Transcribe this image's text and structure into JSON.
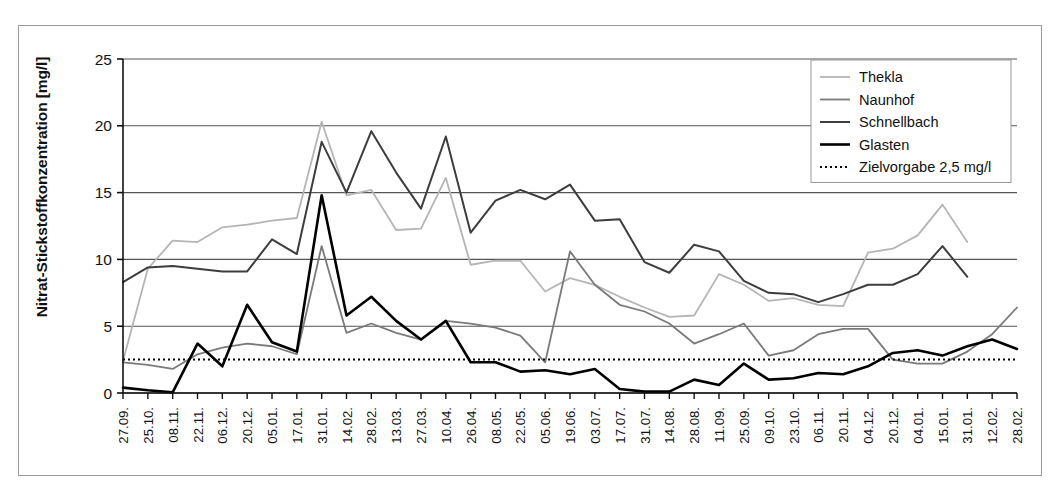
{
  "chart_data": {
    "type": "line",
    "title": "",
    "xlabel": "",
    "ylabel": "Nitrat-Stickstoffkonzentration [mg/l]",
    "ylim": [
      0,
      25
    ],
    "yticks": [
      0,
      5,
      10,
      15,
      20,
      25
    ],
    "grid": true,
    "legend_position": "top-right",
    "categories": [
      "27.09.",
      "25.10.",
      "08.11.",
      "22.11.",
      "06.12.",
      "20.12.",
      "05.01.",
      "17.01.",
      "31.01.",
      "14.02.",
      "28.02.",
      "13.03.",
      "27.03.",
      "10.04.",
      "26.04.",
      "08.05.",
      "22.05.",
      "05.06.",
      "19.06.",
      "03.07.",
      "17.07.",
      "31.07.",
      "14.08.",
      "28.08.",
      "11.09.",
      "25.09.",
      "09.10.",
      "23.10.",
      "06.11.",
      "20.11.",
      "04.12.",
      "20.12.",
      "04.01.",
      "15.01.",
      "31.01.",
      "12.02.",
      "28.02."
    ],
    "series": [
      {
        "name": "Thekla",
        "color": "#b5b5b5",
        "width": 1.8,
        "dash": "",
        "values": [
          2.4,
          9.3,
          11.4,
          11.3,
          12.4,
          12.6,
          12.9,
          13.1,
          20.3,
          14.8,
          15.2,
          12.2,
          12.3,
          16.1,
          9.6,
          9.9,
          9.9,
          7.6,
          8.6,
          8.1,
          7.2,
          6.4,
          5.7,
          5.8,
          8.9,
          8.1,
          6.9,
          7.1,
          6.6,
          6.5,
          10.5,
          10.8,
          11.8,
          14.1,
          11.3,
          null,
          null
        ]
      },
      {
        "name": "Naunhof",
        "color": "#7a7a7a",
        "width": 1.8,
        "dash": "",
        "values": [
          2.3,
          2.1,
          1.8,
          2.9,
          3.4,
          3.7,
          3.5,
          2.9,
          11.0,
          4.5,
          5.2,
          4.5,
          4.0,
          5.4,
          5.2,
          4.9,
          4.3,
          2.3,
          10.6,
          8.1,
          6.6,
          6.1,
          5.2,
          3.7,
          4.4,
          5.2,
          2.8,
          3.2,
          4.4,
          4.8,
          4.8,
          2.5,
          2.2,
          2.2,
          3.1,
          4.4,
          6.4
        ]
      },
      {
        "name": "Schnellbach",
        "color": "#3d3d3d",
        "width": 2.0,
        "dash": "",
        "values": [
          8.3,
          9.4,
          9.5,
          9.3,
          9.1,
          9.1,
          11.5,
          10.4,
          18.8,
          15.0,
          19.6,
          16.5,
          13.8,
          19.2,
          12.0,
          14.4,
          15.2,
          14.5,
          15.6,
          12.9,
          13.0,
          9.8,
          9.0,
          11.1,
          10.6,
          8.4,
          7.5,
          7.4,
          6.8,
          7.4,
          8.1,
          8.1,
          8.9,
          11.0,
          8.7,
          null,
          null
        ]
      },
      {
        "name": "Glasten",
        "color": "#000000",
        "width": 2.6,
        "dash": "",
        "values": [
          0.4,
          0.2,
          0.05,
          3.7,
          2.0,
          6.6,
          3.8,
          3.1,
          14.8,
          5.8,
          7.2,
          5.4,
          4.0,
          5.4,
          2.3,
          2.3,
          1.6,
          1.7,
          1.4,
          1.8,
          0.3,
          0.1,
          0.1,
          1.0,
          0.6,
          2.2,
          1.0,
          1.1,
          1.5,
          1.4,
          2.0,
          3.0,
          3.2,
          2.8,
          3.5,
          4.0,
          3.3
        ]
      }
    ],
    "threshold": {
      "name": "Zielvorgabe 2,5 mg/l",
      "value": 2.5,
      "color": "#000000",
      "dash": "2,3",
      "width": 2.0
    }
  },
  "legend": {
    "items": [
      {
        "label": "Thekla"
      },
      {
        "label": "Naunhof"
      },
      {
        "label": "Schnellbach"
      },
      {
        "label": "Glasten"
      },
      {
        "label": "Zielvorgabe 2,5 mg/l"
      }
    ]
  }
}
